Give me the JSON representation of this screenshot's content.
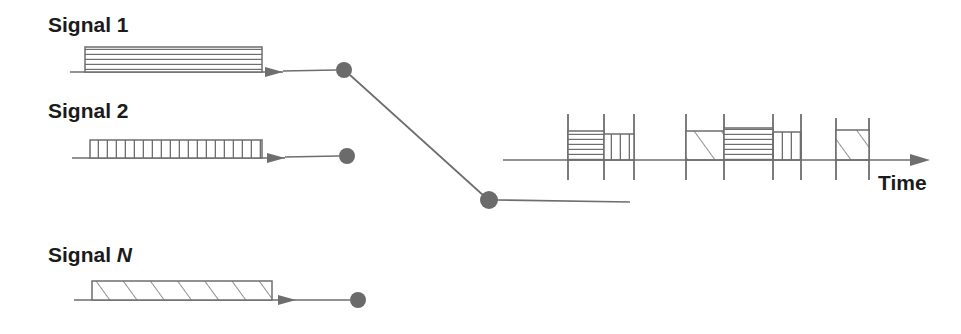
{
  "figure": {
    "title": "",
    "colors": {
      "stroke": "#6e6e6e",
      "node": "#6b6b6b",
      "text": "#1b1b1b",
      "background": "#ffffff"
    },
    "axis": {
      "label": "Time",
      "label_x": 878,
      "label_y": 190,
      "line": {
        "x1": 503,
        "y1": 160,
        "x2": 930,
        "y2": 160
      },
      "arrow_tip_x": 930
    },
    "signals": [
      {
        "id": "signal-1",
        "label": "Signal 1",
        "label_italic_tail": "",
        "label_x": 48,
        "label_y": 32,
        "baseline": {
          "x1": 70,
          "y": 72,
          "x2": 283
        },
        "block": {
          "x": 85,
          "y": 47,
          "w": 177,
          "h": 25
        },
        "hatch": "horizontal",
        "arrow_tip_x": 283,
        "node": {
          "cx": 344,
          "cy": 70,
          "r": 8
        },
        "connector": {
          "x1": 283,
          "y1": 71,
          "x2": 336,
          "y2": 70
        }
      },
      {
        "id": "signal-2",
        "label": "Signal 2",
        "label_italic_tail": "",
        "label_x": 48,
        "label_y": 118,
        "baseline": {
          "x1": 72,
          "y": 158,
          "x2": 285
        },
        "block": {
          "x": 90,
          "y": 140,
          "w": 172,
          "h": 18
        },
        "hatch": "vertical",
        "arrow_tip_x": 285,
        "node": {
          "cx": 347,
          "cy": 156,
          "r": 8
        },
        "connector": {
          "x1": 285,
          "y1": 157,
          "x2": 339,
          "y2": 156
        }
      },
      {
        "id": "signal-n",
        "label": "Signal ",
        "label_italic_tail": "N",
        "label_x": 48,
        "label_y": 262,
        "baseline": {
          "x1": 74,
          "y": 300,
          "x2": 296
        },
        "block": {
          "x": 92,
          "y": 281,
          "w": 180,
          "h": 19
        },
        "hatch": "diagonal",
        "arrow_tip_x": 296,
        "node": {
          "cx": 358,
          "cy": 300,
          "r": 8
        },
        "connector": {
          "x1": 296,
          "y1": 300,
          "x2": 350,
          "y2": 300
        }
      }
    ],
    "fan": {
      "top_node": {
        "cx": 344,
        "cy": 70,
        "r": 8
      },
      "bottom_node": {
        "cx": 489,
        "cy": 200,
        "r": 9
      },
      "diagonal": {
        "x1": 350,
        "y1": 75,
        "x2": 484,
        "y2": 196
      },
      "tail": {
        "x1": 497,
        "y1": 200,
        "x2": 630,
        "y2": 202
      }
    },
    "timeline_clusters": [
      {
        "id": "cluster-1",
        "ticks": [
          568,
          604,
          634
        ],
        "tick_top": 114,
        "tick_bottom": 180,
        "blocks": [
          {
            "x": 568,
            "y": 131,
            "w": 36,
            "h": 29,
            "hatch": "horizontal",
            "signal": "Signal 1"
          },
          {
            "x": 604,
            "y": 134,
            "w": 30,
            "h": 26,
            "hatch": "vertical",
            "signal": "Signal 2"
          }
        ]
      },
      {
        "id": "cluster-2",
        "ticks": [
          686,
          724,
          773,
          801
        ],
        "tick_top": 114,
        "tick_bottom": 180,
        "blocks": [
          {
            "x": 686,
            "y": 131,
            "w": 38,
            "h": 29,
            "hatch": "diagonal",
            "signal": "Signal N"
          },
          {
            "x": 724,
            "y": 128,
            "w": 49,
            "h": 32,
            "hatch": "horizontal",
            "signal": "Signal 1"
          },
          {
            "x": 773,
            "y": 132,
            "w": 28,
            "h": 28,
            "hatch": "vertical",
            "signal": "Signal 2"
          }
        ]
      },
      {
        "id": "cluster-3",
        "ticks": [
          836,
          869
        ],
        "tick_top": 118,
        "tick_bottom": 180,
        "blocks": [
          {
            "x": 836,
            "y": 130,
            "w": 33,
            "h": 30,
            "hatch": "diagonal",
            "signal": "Signal N"
          }
        ]
      }
    ]
  }
}
